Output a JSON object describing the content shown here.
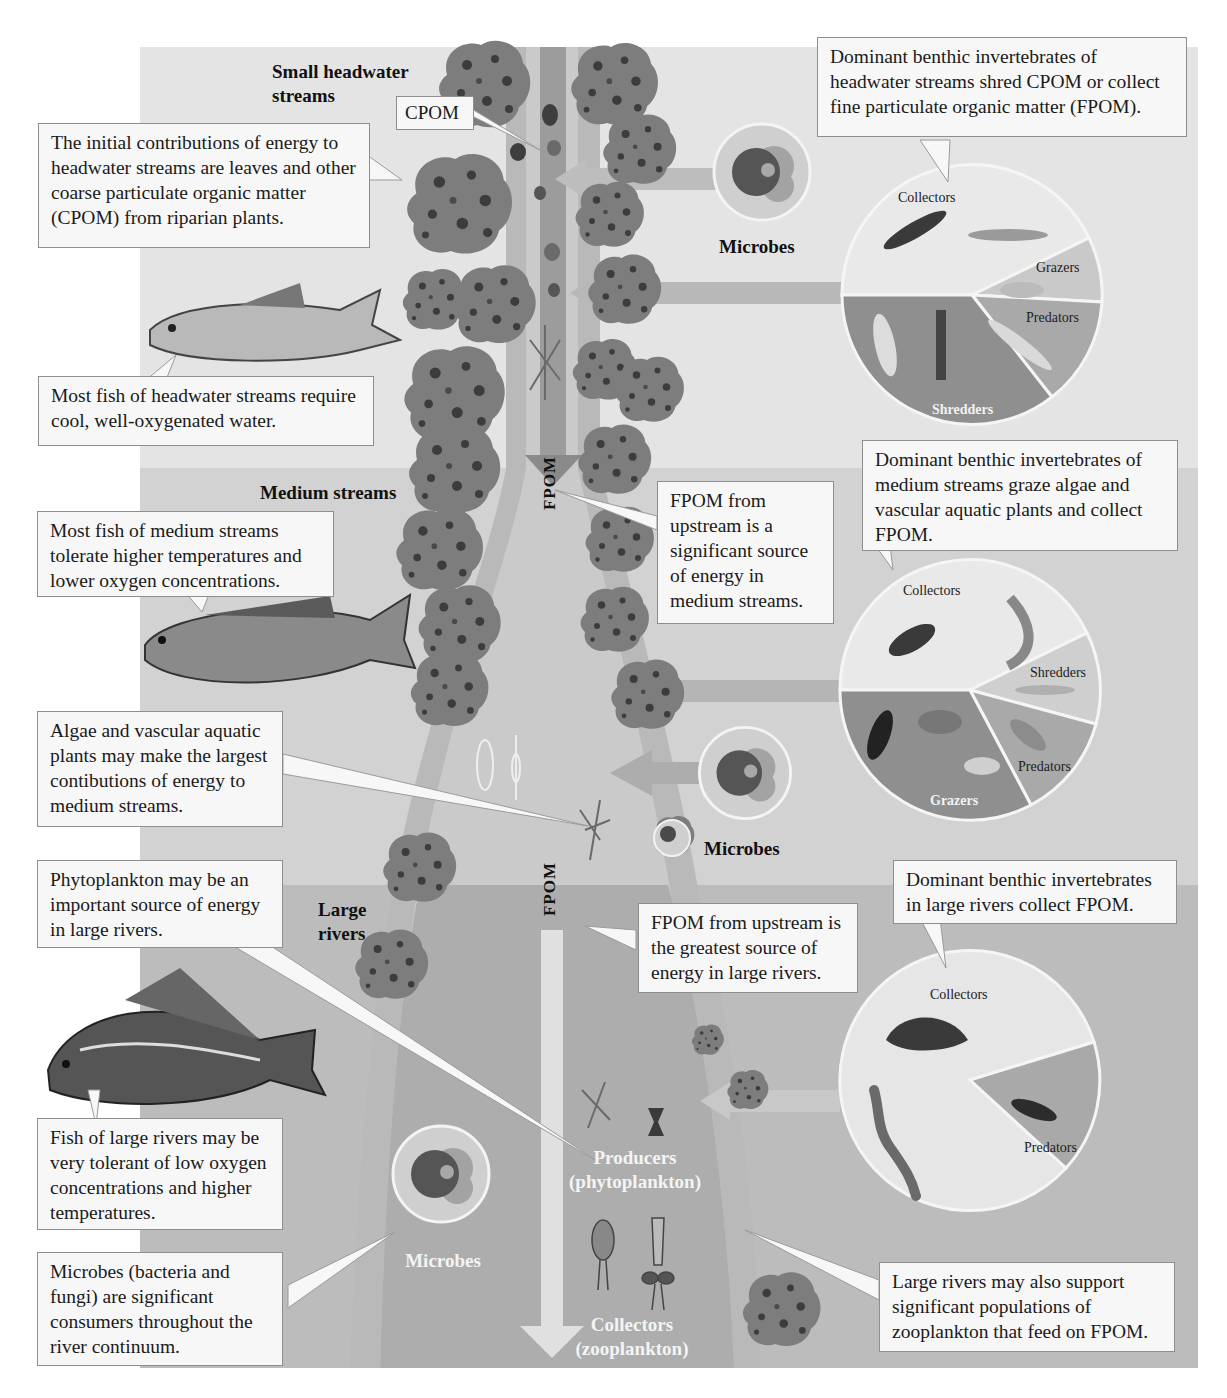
{
  "colors": {
    "headwater_band": "#e4e4e4",
    "medium_band": "#d2d2d2",
    "large_band": "#bcbcbc",
    "river_light": "#c8c8c8",
    "river_medium": "#b4b4b4",
    "river_large": "#a6a6a6",
    "tree_fill": "#7d7d7d",
    "tree_spot": "#3c3c3c",
    "callout_bg": "#f7f7f7",
    "callout_border": "#8e8e8e"
  },
  "zones": {
    "headwater": "Small headwater streams",
    "headwater_line1": "Small headwater",
    "headwater_line2": "streams",
    "medium": "Medium streams",
    "large_line1": "Large",
    "large_line2": "rivers"
  },
  "labels": {
    "cpom": "CPOM",
    "fpom_top": "FPOM",
    "fpom_bottom": "FPOM",
    "microbes_top": "Microbes",
    "microbes_mid": "Microbes",
    "microbes_bottom": "Microbes",
    "producers_line1": "Producers",
    "producers_line2": "(phytoplankton)",
    "collectors_line1": "Collectors",
    "collectors_line2": "(zooplankton)"
  },
  "callouts": {
    "headwater_energy": "The initial contributions of energy to headwater streams are leaves and other coarse particulate organic matter (CPOM) from riparian plants.",
    "headwater_fish": "Most fish of headwater streams require cool, well-oxygenated water.",
    "headwater_invertebrates": "Dominant benthic invertebrates of headwater streams shred CPOM or collect fine particulate organic matter (FPOM).",
    "medium_fish": "Most fish of medium streams tolerate higher temperatures and lower oxygen concentrations.",
    "medium_fpom": "FPOM from upstream is a significant source of energy in medium streams.",
    "medium_invertebrates": "Dominant benthic invertebrates of medium streams graze algae and vascular aquatic plants and collect FPOM.",
    "medium_algae": "Algae and vascular aquatic plants may make the largest contibutions of energy to medium streams.",
    "large_phytoplankton": "Phytoplankton may be an important source of energy in  large rivers.",
    "large_fpom": "FPOM from upstream is the greatest source of energy in large rivers.",
    "large_invertebrates": "Dominant benthic invertebrates in large rivers collect FPOM.",
    "large_fish": "Fish of large rivers may be very tolerant of low oxygen concentrations and higher temperatures.",
    "microbes_consumers": "Microbes (bacteria and fungi) are significant consumers throughout the river continuum.",
    "large_zooplankton": "Large rivers may also support significant populations of zooplankton that feed on FPOM."
  },
  "pies": {
    "headwater": {
      "slices": [
        {
          "label": "Collectors",
          "fill": "#e9e9e9"
        },
        {
          "label": "Grazers",
          "fill": "#c9c9c9"
        },
        {
          "label": "Predators",
          "fill": "#a9a9a9"
        },
        {
          "label": "Shredders",
          "fill": "#8f8f8f"
        }
      ]
    },
    "medium": {
      "slices": [
        {
          "label": "Collectors",
          "fill": "#e9e9e9"
        },
        {
          "label": "Shredders",
          "fill": "#cfcfcf"
        },
        {
          "label": "Predators",
          "fill": "#a9a9a9"
        },
        {
          "label": "Grazers",
          "fill": "#8f8f8f"
        }
      ]
    },
    "large": {
      "slices": [
        {
          "label": "Collectors",
          "fill": "#e6e6e6"
        },
        {
          "label": "Predators",
          "fill": "#a9a9a9"
        }
      ]
    }
  }
}
